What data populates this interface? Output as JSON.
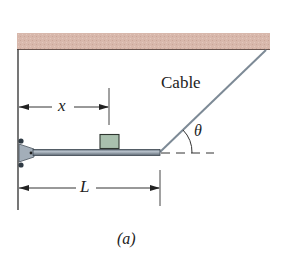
{
  "figure": {
    "caption": "(a)",
    "labels": {
      "cable": "Cable",
      "angle": "θ",
      "x_dimension": "x",
      "length_dimension": "L"
    },
    "colors": {
      "ceiling": "#d9b9ad",
      "beam": "#8f9aa6",
      "block": "#a9c0ae",
      "cable": "#7d8a96",
      "lines": "#333333"
    }
  }
}
